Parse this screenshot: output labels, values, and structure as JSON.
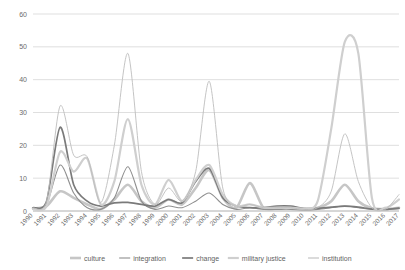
{
  "chart_data": {
    "type": "line",
    "title": "",
    "xlabel": "",
    "ylabel": "",
    "ylim": [
      0,
      60
    ],
    "yticks": [
      0,
      10,
      20,
      30,
      40,
      50,
      60
    ],
    "grid": true,
    "legend_position": "bottom",
    "x": [
      1990,
      1991,
      1992,
      1993,
      1994,
      1995,
      1996,
      1997,
      1998,
      1999,
      2000,
      2001,
      2002,
      2003,
      2004,
      2005,
      2006,
      2007,
      2008,
      2009,
      2010,
      2011,
      2012,
      2013,
      2014,
      2015,
      2016,
      2017
    ],
    "categories": [
      "1990",
      "1991",
      "1992",
      "1993",
      "1994",
      "1995",
      "1996",
      "1997",
      "1998",
      "1999",
      "2000",
      "2001",
      "2002",
      "2003",
      "2004",
      "2005",
      "2006",
      "2007",
      "2008",
      "2009",
      "2010",
      "2011",
      "2012",
      "2013",
      "2014",
      "2015",
      "2016",
      "2017"
    ],
    "series": [
      {
        "name": "culture",
        "color": "#c6c6c6",
        "width": 2.6,
        "values": [
          0.8,
          1.5,
          6.0,
          4.0,
          2.0,
          0.6,
          3.5,
          8.0,
          3.0,
          1.0,
          3.5,
          2.0,
          7.0,
          12.5,
          4.0,
          1.0,
          8.5,
          1.0,
          0.8,
          1.2,
          0.6,
          1.0,
          3.0,
          8.0,
          3.0,
          0.8,
          0.6,
          1.0
        ]
      },
      {
        "name": "integration",
        "color": "#8f8f8f",
        "width": 1.1,
        "values": [
          0.5,
          2.0,
          14.0,
          5.5,
          1.0,
          0.5,
          4.0,
          13.5,
          3.0,
          0.5,
          1.5,
          1.0,
          3.0,
          5.5,
          2.0,
          0.5,
          1.0,
          0.5,
          0.5,
          0.5,
          0.3,
          0.5,
          1.0,
          1.5,
          1.0,
          0.5,
          0.5,
          1.0
        ]
      },
      {
        "name": "change",
        "color": "#7a7a7a",
        "width": 1.7,
        "values": [
          1.0,
          3.0,
          25.5,
          8.0,
          3.0,
          1.5,
          2.5,
          2.6,
          2.0,
          1.5,
          3.5,
          2.5,
          9.0,
          13.0,
          4.0,
          1.5,
          1.0,
          1.0,
          1.5,
          1.5,
          0.8,
          0.8,
          1.2,
          1.5,
          1.2,
          0.6,
          0.5,
          0.8
        ]
      },
      {
        "name": "military justice",
        "color": "#cfcfcf",
        "width": 2.2,
        "values": [
          0.6,
          1.5,
          18.0,
          12.0,
          16.0,
          2.0,
          9.0,
          28.0,
          8.0,
          2.0,
          9.5,
          3.0,
          9.5,
          14.0,
          5.0,
          1.5,
          2.0,
          1.0,
          1.0,
          1.0,
          0.8,
          3.0,
          25.0,
          51.5,
          48.0,
          4.0,
          1.0,
          3.5
        ]
      },
      {
        "name": "institution",
        "color": "#bdbdbd",
        "width": 0.9,
        "values": [
          1.0,
          3.0,
          32.0,
          17.0,
          16.5,
          2.5,
          20.0,
          48.0,
          12.0,
          2.0,
          7.0,
          3.0,
          12.0,
          39.5,
          7.0,
          1.5,
          2.0,
          1.0,
          1.0,
          1.0,
          0.5,
          1.0,
          6.0,
          23.5,
          9.0,
          1.0,
          0.5,
          5.0
        ]
      }
    ]
  },
  "legend": {
    "items": [
      {
        "label": "culture"
      },
      {
        "label": "integration"
      },
      {
        "label": "change"
      },
      {
        "label": "military justice"
      },
      {
        "label": "institution"
      }
    ]
  }
}
